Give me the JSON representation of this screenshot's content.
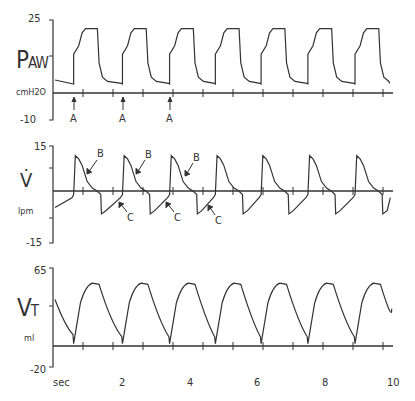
{
  "panels": [
    {
      "id": "paw",
      "label_main": "P",
      "label_sub": "AW",
      "unit": "cmH2O",
      "ymax_label": "25",
      "ymin_label": "-10",
      "ymax": 25,
      "ymin": -10
    },
    {
      "id": "flow",
      "label_main": "V̇",
      "label_sub": "",
      "unit": "lpm",
      "ymax_label": "15",
      "ymin_label": "-15",
      "ymax": 15,
      "ymin": -15
    },
    {
      "id": "vt",
      "label_main": "V",
      "label_sub": "T",
      "unit": "ml",
      "ymax_label": "65",
      "ymin_label": "-20",
      "ymax": 65,
      "ymin": -20
    }
  ],
  "xaxis": {
    "unit_label": "sec",
    "ticks": [
      "2",
      "4",
      "6",
      "8",
      "10"
    ]
  },
  "annotations": {
    "A": "A",
    "B": "B",
    "C": "C"
  },
  "chart_data": {
    "type": "line",
    "title": "",
    "xlabel": "sec",
    "xlim": [
      0,
      10
    ],
    "xticks": [
      2,
      4,
      6,
      8,
      10
    ],
    "breath_start_times_sec": [
      0.55,
      1.99,
      3.38,
      4.73,
      6.08,
      7.46,
      8.85
    ],
    "series": [
      {
        "name": "Paw (cmH2O)",
        "ylim": [
          -10,
          25
        ],
        "baseline": 3,
        "peak_plateau": 22,
        "shape": "square pressure waveform, rise then plateau ~1 s, drop to PEEP ~3"
      },
      {
        "name": "Flow V (lpm)",
        "ylim": [
          -15,
          15
        ],
        "peak_inspiratory": 11,
        "peak_expiratory": -6,
        "shape": "decelerating inspiratory flow, negative expiratory flow returning toward 0"
      },
      {
        "name": "Vt (ml)",
        "ylim": [
          -20,
          65
        ],
        "peak": 50,
        "end_expiratory": 5,
        "shape": "rise to ~50 ml then exponential decay"
      }
    ],
    "annotations": [
      {
        "label": "A",
        "panel": "paw",
        "times_sec": [
          0.55,
          1.99,
          3.38
        ],
        "meaning": "breath trigger"
      },
      {
        "label": "B",
        "panel": "flow",
        "count": 3
      },
      {
        "label": "C",
        "panel": "flow",
        "count": 3
      }
    ]
  }
}
